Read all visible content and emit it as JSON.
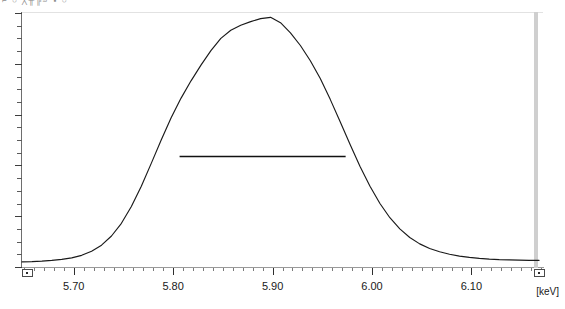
{
  "window": {
    "toolbar_fragment": "⌐ ○   ╳╫╠╝  ▪ ○"
  },
  "plot": {
    "unit_label": "[keV]",
    "cursor_marker_keV": 6.165,
    "left_handle": "range-start-handle",
    "right_handle": "range-end-handle"
  },
  "chart_data": {
    "type": "line",
    "title": "",
    "xlabel": "[keV]",
    "ylabel": "",
    "xlim": [
      5.648,
      6.172
    ],
    "ylim": [
      0,
      1.0
    ],
    "grid": false,
    "legend": null,
    "x_tick_labels": [
      "5.70",
      "5.80",
      "5.90",
      "6.00",
      "6.10"
    ],
    "x_tick_values": [
      5.7,
      5.8,
      5.9,
      6.0,
      6.1
    ],
    "x_minor_tick_step": 0.01,
    "y_tick_count": 21,
    "y_tick_labels": [],
    "annotations": [
      {
        "name": "fwhm-line",
        "type": "horizontal-segment",
        "x_start": 5.8065,
        "x_end": 5.9735,
        "y": 0.435,
        "label": ""
      }
    ],
    "peak": {
      "center_keV": 5.8945,
      "height": 0.983
    },
    "series": [
      {
        "name": "spectrum",
        "color": "#1a1a1a",
        "x": [
          5.648,
          5.658,
          5.668,
          5.678,
          5.688,
          5.698,
          5.708,
          5.718,
          5.728,
          5.738,
          5.748,
          5.758,
          5.768,
          5.778,
          5.788,
          5.798,
          5.808,
          5.818,
          5.828,
          5.838,
          5.848,
          5.858,
          5.868,
          5.878,
          5.888,
          5.898,
          5.908,
          5.918,
          5.928,
          5.938,
          5.948,
          5.958,
          5.968,
          5.978,
          5.988,
          5.998,
          6.008,
          6.018,
          6.028,
          6.038,
          6.048,
          6.058,
          6.068,
          6.078,
          6.088,
          6.098,
          6.108,
          6.118,
          6.128,
          6.138,
          6.148,
          6.158,
          6.168
        ],
        "y": [
          0.02,
          0.021,
          0.023,
          0.026,
          0.03,
          0.036,
          0.046,
          0.062,
          0.086,
          0.122,
          0.172,
          0.238,
          0.318,
          0.408,
          0.5,
          0.588,
          0.665,
          0.733,
          0.795,
          0.852,
          0.9,
          0.932,
          0.952,
          0.966,
          0.978,
          0.983,
          0.962,
          0.922,
          0.872,
          0.812,
          0.742,
          0.66,
          0.572,
          0.482,
          0.396,
          0.318,
          0.25,
          0.194,
          0.15,
          0.116,
          0.091,
          0.073,
          0.06,
          0.05,
          0.043,
          0.038,
          0.034,
          0.031,
          0.029,
          0.028,
          0.027,
          0.026,
          0.026
        ]
      }
    ]
  }
}
